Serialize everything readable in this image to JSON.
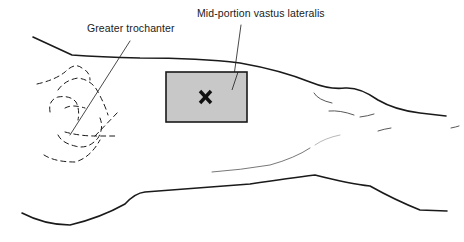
{
  "diagram": {
    "labels": {
      "greater_trochanter": "Greater trochanter",
      "vastus_lateralis": "Mid-portion vastus lateralis"
    },
    "injection_site": {
      "marker": "×",
      "fill_color": "#c8c8c8",
      "stroke_color": "#1a1a1a"
    },
    "line_color": "#1a1a1a"
  }
}
